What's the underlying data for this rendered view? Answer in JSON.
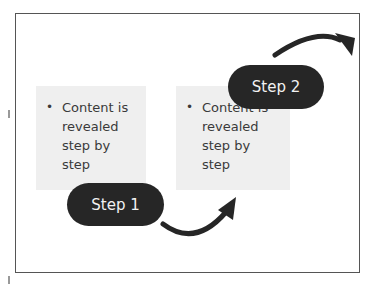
{
  "slide": {
    "steps": [
      {
        "label": "Step 1",
        "content": "Content is revealed step by step"
      },
      {
        "label": "Step 2",
        "content": "Content is revealed step by step"
      }
    ],
    "bullet_glyph": "•",
    "colors": {
      "pill": "#262626",
      "pill_text": "#f2f2f2",
      "box": "#efefef",
      "arrow": "#262626",
      "frame": "#555555"
    }
  }
}
